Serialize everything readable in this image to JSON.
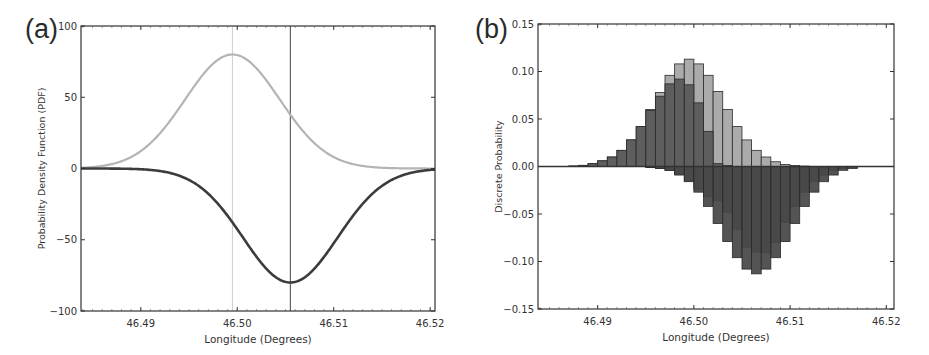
{
  "chart_data": [
    {
      "panel": "(a)",
      "type": "line",
      "title": "",
      "xlabel": "Longitude (Degrees)",
      "ylabel": "Probability Density Function (PDF)",
      "xlim": [
        46.4838,
        46.5205
      ],
      "ylim": [
        -100,
        100
      ],
      "xticks": [
        "46.49",
        "46.50",
        "46.51",
        "46.52"
      ],
      "yticks": [
        "100",
        "50",
        "0",
        "−50",
        "−100"
      ],
      "grid": false,
      "legend": null,
      "series": [
        {
          "name": "positive PDF (light)",
          "color": "#b4b4b4",
          "shape": "gaussian",
          "mean": 46.4995,
          "sigma": 0.0049,
          "peak": 80
        },
        {
          "name": "negative PDF (dark)",
          "color": "#3c3c3c",
          "shape": "gaussian",
          "mean": 46.5055,
          "sigma": 0.0049,
          "peak": -80
        }
      ],
      "vlines": [
        {
          "x": 46.4995,
          "color": "#cfcfcf"
        },
        {
          "x": 46.5055,
          "color": "#444444"
        }
      ]
    },
    {
      "panel": "(b)",
      "type": "bar",
      "title": "",
      "xlabel": "Longitude (Degrees)",
      "ylabel": "Discrete Probability",
      "xlim": [
        46.4838,
        46.5208
      ],
      "ylim": [
        -0.15,
        0.15
      ],
      "xticks": [
        "46.49",
        "46.50",
        "46.51",
        "46.52"
      ],
      "yticks": [
        "0.15",
        "0.10",
        "0.05",
        "0.00",
        "−0.05",
        "−0.10",
        "−0.15"
      ],
      "grid": false,
      "bin_width": 0.001,
      "bin_starts": [
        46.487,
        46.488,
        46.489,
        46.49,
        46.491,
        46.492,
        46.493,
        46.494,
        46.495,
        46.496,
        46.497,
        46.498,
        46.499,
        46.5,
        46.501,
        46.502,
        46.503,
        46.504,
        46.505,
        46.506,
        46.507,
        46.508,
        46.509,
        46.51,
        46.511,
        46.512,
        46.513,
        46.514,
        46.515,
        46.516
      ],
      "series": [
        {
          "name": "positive light",
          "color": "#ababab",
          "values": [
            0.0005,
            0.0012,
            0.003,
            0.006,
            0.01,
            0.017,
            0.028,
            0.042,
            0.06,
            0.078,
            0.096,
            0.108,
            0.113,
            0.108,
            0.096,
            0.079,
            0.06,
            0.042,
            0.028,
            0.017,
            0.01,
            0.005,
            0.002,
            0.001,
            0.0004,
            0,
            0,
            0,
            0,
            0
          ]
        },
        {
          "name": "positive dark",
          "color": "#5e5e5e",
          "values": [
            0.0005,
            0.0012,
            0.003,
            0.006,
            0.01,
            0.017,
            0.028,
            0.042,
            0.059,
            0.074,
            0.087,
            0.092,
            0.086,
            0.067,
            0.037,
            0.003,
            0.001,
            0,
            0,
            0,
            0,
            0,
            0,
            0,
            0,
            0,
            0,
            0,
            0,
            0
          ]
        },
        {
          "name": "negative medium",
          "color": "#6a6a6a",
          "values": [
            0,
            0,
            0,
            0,
            0,
            0,
            0,
            0,
            -0.001,
            -0.002,
            -0.004,
            -0.008,
            -0.015,
            -0.024,
            -0.032,
            -0.036,
            -0.048,
            -0.066,
            -0.085,
            -0.09,
            -0.091,
            -0.08,
            -0.059,
            -0.042,
            -0.027,
            -0.016,
            -0.009,
            -0.004,
            -0.002,
            -0.0008
          ]
        },
        {
          "name": "negative dark",
          "color": "#454545",
          "values": [
            0,
            0,
            0,
            0,
            0,
            0,
            0,
            0,
            -0.001,
            -0.002,
            -0.004,
            -0.009,
            -0.016,
            -0.027,
            -0.042,
            -0.06,
            -0.079,
            -0.096,
            -0.108,
            -0.113,
            -0.108,
            -0.096,
            -0.079,
            -0.06,
            -0.042,
            -0.027,
            -0.016,
            -0.009,
            -0.004,
            -0.002
          ]
        }
      ]
    }
  ],
  "labels": {
    "panel_a": "(a)",
    "panel_b": "(b)"
  }
}
